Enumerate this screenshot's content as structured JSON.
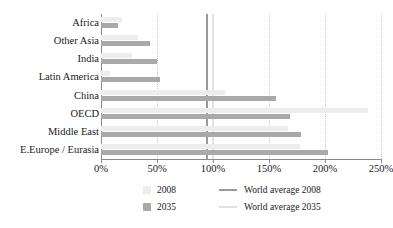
{
  "chart_data": {
    "type": "bar",
    "orientation": "horizontal",
    "title": "",
    "xlabel": "",
    "ylabel": "",
    "xlim": [
      0,
      250
    ],
    "xticks": [
      "0%",
      "50%",
      "100%",
      "150%",
      "200%",
      "250%"
    ],
    "xtick_values": [
      0,
      50,
      100,
      150,
      200,
      250
    ],
    "grid": true,
    "legend_position": "bottom",
    "categories": [
      "Africa",
      "Other Asia",
      "India",
      "Latin America",
      "China",
      "OECD",
      "Middle East",
      "E.Europe / Eurasia"
    ],
    "series": [
      {
        "name": "2008",
        "color": "#ededed",
        "values": [
          19,
          33,
          28,
          8,
          111,
          238,
          167,
          178
        ]
      },
      {
        "name": "2035",
        "color": "#a9a9a9",
        "values": [
          15,
          44,
          50,
          53,
          156,
          169,
          179,
          203
        ]
      }
    ],
    "reference_lines": [
      {
        "name": "World average 2008",
        "value": 95,
        "color": "#9a9a9a"
      },
      {
        "name": "World average 2035",
        "value": 100,
        "color": "#e2e2e2"
      }
    ]
  },
  "legend": {
    "entries": [
      {
        "label": "2008",
        "kind": "swatch"
      },
      {
        "label": "2035",
        "kind": "swatch"
      },
      {
        "label": "World average 2008",
        "kind": "line"
      },
      {
        "label": "World average 2035",
        "kind": "line"
      }
    ]
  }
}
